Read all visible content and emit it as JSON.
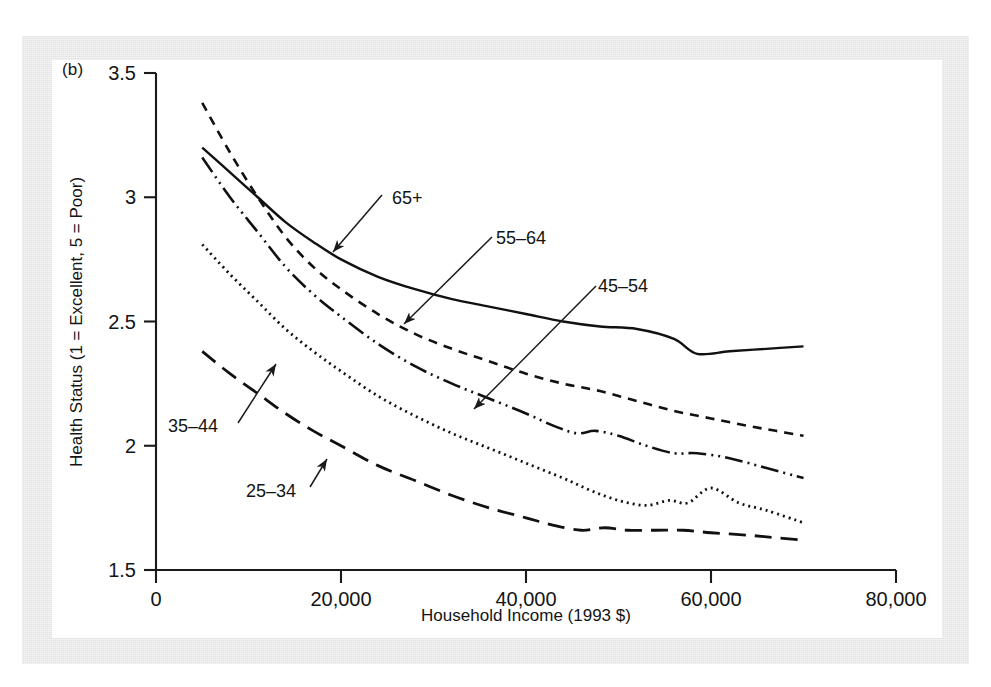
{
  "figure": {
    "panel_label": "(b)",
    "background_color": "#e9e9e9",
    "plot_background_color": "#ffffff",
    "ink_color": "#111111"
  },
  "chart_data": {
    "type": "line",
    "title": "",
    "xlabel": "Household Income (1993 $)",
    "ylabel": "Health Status (1 = Excellent, 5 = Poor)",
    "xlim": [
      0,
      80000
    ],
    "ylim": [
      1.5,
      3.5
    ],
    "grid": false,
    "legend_position": "inline-annotations",
    "xticks": [
      0,
      20000,
      40000,
      60000,
      80000
    ],
    "xtick_labels": [
      "0",
      "20,000",
      "40,000",
      "60,000",
      "80,000"
    ],
    "yticks": [
      1.5,
      2,
      2.5,
      3,
      3.5
    ],
    "ytick_labels": [
      "1.5",
      "2",
      "2.5",
      "3",
      "3.5"
    ],
    "series": [
      {
        "name": "65+",
        "label": "65+",
        "line_style": "solid",
        "dasharray": "",
        "stroke_width": 2.4,
        "x": [
          5000,
          8000,
          11000,
          14000,
          17000,
          20000,
          24000,
          28000,
          32000,
          36000,
          40000,
          44000,
          48000,
          52000,
          56000,
          58500,
          62000,
          66000,
          70000
        ],
        "y": [
          3.2,
          3.1,
          3.0,
          2.9,
          2.82,
          2.75,
          2.68,
          2.63,
          2.59,
          2.56,
          2.53,
          2.5,
          2.48,
          2.47,
          2.43,
          2.37,
          2.38,
          2.39,
          2.4
        ]
      },
      {
        "name": "55-64",
        "label": "55–64",
        "line_style": "dashed",
        "dasharray": "9,7",
        "stroke_width": 2.6,
        "x": [
          5000,
          8000,
          11000,
          14000,
          17000,
          20000,
          24000,
          28000,
          32000,
          36000,
          40000,
          44000,
          48000,
          52000,
          56000,
          60000,
          64000,
          67000,
          70000
        ],
        "y": [
          3.38,
          3.18,
          3.0,
          2.84,
          2.72,
          2.63,
          2.53,
          2.45,
          2.39,
          2.34,
          2.29,
          2.25,
          2.22,
          2.18,
          2.14,
          2.11,
          2.08,
          2.06,
          2.04
        ]
      },
      {
        "name": "45-54",
        "label": "45–54",
        "line_style": "dash-dot-dot",
        "dasharray": "18,5,2,5,2,5",
        "stroke_width": 2.6,
        "x": [
          5000,
          8000,
          11000,
          14000,
          17000,
          20000,
          24000,
          28000,
          32000,
          36000,
          40000,
          43000,
          45500,
          47500,
          50000,
          53000,
          56000,
          58500,
          62000,
          66000,
          70000
        ],
        "y": [
          3.16,
          3.0,
          2.86,
          2.72,
          2.61,
          2.52,
          2.41,
          2.32,
          2.25,
          2.19,
          2.13,
          2.08,
          2.05,
          2.06,
          2.04,
          2.0,
          1.97,
          1.97,
          1.95,
          1.91,
          1.87
        ]
      },
      {
        "name": "35-44",
        "label": "35–44",
        "line_style": "dotted",
        "dasharray": "2,4",
        "stroke_width": 2.8,
        "x": [
          5000,
          8000,
          11000,
          14000,
          17000,
          20000,
          24000,
          28000,
          32000,
          36000,
          40000,
          44000,
          47000,
          50000,
          53000,
          55500,
          57500,
          60000,
          63000,
          66000,
          70000
        ],
        "y": [
          2.81,
          2.69,
          2.58,
          2.47,
          2.38,
          2.3,
          2.2,
          2.12,
          2.05,
          1.99,
          1.93,
          1.87,
          1.82,
          1.78,
          1.76,
          1.78,
          1.77,
          1.83,
          1.77,
          1.74,
          1.69
        ]
      },
      {
        "name": "25-34",
        "label": "25–34",
        "line_style": "long-dash",
        "dasharray": "17,9",
        "stroke_width": 2.8,
        "x": [
          5000,
          8000,
          11000,
          14000,
          17000,
          20000,
          24000,
          28000,
          32000,
          36000,
          40000,
          43000,
          46000,
          48500,
          51000,
          54000,
          57000,
          60000,
          64000,
          67000,
          70000
        ],
        "y": [
          2.38,
          2.29,
          2.21,
          2.13,
          2.06,
          2.0,
          1.92,
          1.86,
          1.8,
          1.75,
          1.71,
          1.68,
          1.66,
          1.67,
          1.66,
          1.66,
          1.66,
          1.65,
          1.64,
          1.63,
          1.62
        ]
      }
    ],
    "annotations": [
      {
        "name": "annotation-65plus",
        "text": "65+",
        "text_x": 392,
        "text_y": 204,
        "arrow_from_x": 382,
        "arrow_from_y": 195,
        "arrow_to_x": 333,
        "arrow_to_y": 252
      },
      {
        "name": "annotation-55-64",
        "text": "55–64",
        "text_x": 496,
        "text_y": 244,
        "arrow_from_x": 492,
        "arrow_from_y": 237,
        "arrow_to_x": 404,
        "arrow_to_y": 324
      },
      {
        "name": "annotation-45-54",
        "text": "45–54",
        "text_x": 598,
        "text_y": 292,
        "arrow_from_x": 596,
        "arrow_from_y": 286,
        "arrow_to_x": 474,
        "arrow_to_y": 409
      },
      {
        "name": "annotation-35-44",
        "text": "35–44",
        "text_x": 168,
        "text_y": 432,
        "arrow_from_x": 238,
        "arrow_from_y": 423,
        "arrow_to_x": 276,
        "arrow_to_y": 364
      },
      {
        "name": "annotation-25-34",
        "text": "25–34",
        "text_x": 246,
        "text_y": 497,
        "arrow_from_x": 310,
        "arrow_from_y": 487,
        "arrow_to_x": 327,
        "arrow_to_y": 459
      }
    ]
  }
}
